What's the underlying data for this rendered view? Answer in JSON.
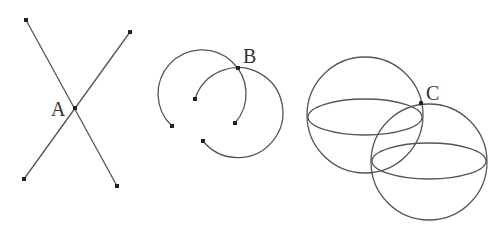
{
  "diagram": {
    "panels": [
      {
        "id": "lines",
        "description": "Two intersecting line segments",
        "point_label": "A",
        "segments": [
          {
            "from": [
              26,
              20
            ],
            "to": [
              117,
              186
            ]
          },
          {
            "from": [
              130,
              32
            ],
            "to": [
              24,
              179
            ]
          }
        ],
        "intersection": [
          75,
          108
        ]
      },
      {
        "id": "circles",
        "description": "Two intersecting circular arcs",
        "point_label": "B",
        "intersection": [
          238,
          68
        ]
      },
      {
        "id": "spheres",
        "description": "Two intersecting spheres with equators",
        "point_label": "C",
        "intersection": [
          421,
          103
        ]
      }
    ],
    "colors": {
      "stroke": "#555555",
      "point": "#222222",
      "label": "#333333"
    }
  }
}
